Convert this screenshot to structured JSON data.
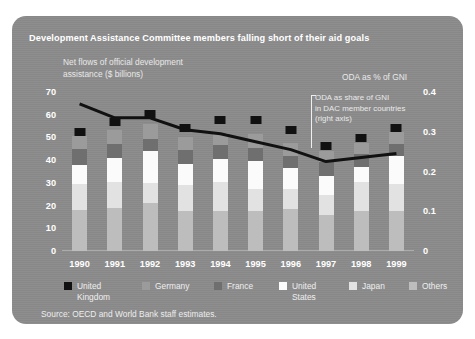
{
  "figure": {
    "title": "Development Assistance Committee members falling short of their aid goals",
    "left_axis_note": "Net flows of official development\nassistance ($ billions)",
    "right_axis_note": "ODA as % of GNI",
    "callout": "ODA as share of GNI\nin DAC member countries\n(right axis)",
    "source": "Source: OECD and World Bank staff estimates.",
    "panel_color": "#8b8b8b",
    "text_color": "#ffffff"
  },
  "chart_data": {
    "type": "bar",
    "title": "Development Assistance Committee members falling short of their aid goals",
    "subtitle": "Net flows of official development assistance ($ billions)",
    "xlabel": "",
    "ylabel": "Net flows of official development assistance ($ billions)",
    "ylabel_right": "ODA as % of GNI",
    "ylim": [
      0,
      70
    ],
    "ylim_right": [
      0,
      0.4
    ],
    "yticks": [
      "0",
      "10",
      "20",
      "30",
      "40",
      "50",
      "60",
      "70"
    ],
    "yticks_right": [
      "0",
      "0.1",
      "0.2",
      "0.3",
      "0.4"
    ],
    "grid": false,
    "legend_position": "bottom",
    "stacked": true,
    "categories": [
      "1990",
      "1991",
      "1992",
      "1993",
      "1994",
      "1995",
      "1996",
      "1997",
      "1998",
      "1999"
    ],
    "series": [
      {
        "name": "Others",
        "color": "#bdbdbd",
        "values": [
          18.0,
          19.0,
          21.0,
          17.5,
          17.5,
          17.5,
          18.5,
          16.0,
          17.5,
          17.5
        ]
      },
      {
        "name": "Japan",
        "color": "#e2e2e2",
        "values": [
          11.5,
          11.5,
          9.0,
          11.5,
          13.0,
          10.0,
          9.0,
          8.5,
          13.0,
          12.0
        ]
      },
      {
        "name": "United States",
        "color": "#fbfbfb",
        "values": [
          8.5,
          10.5,
          14.0,
          9.5,
          10.0,
          12.0,
          9.0,
          8.5,
          6.5,
          12.5
        ]
      },
      {
        "name": "France",
        "color": "#6f6f6f",
        "values": [
          7.0,
          6.0,
          5.5,
          6.0,
          6.0,
          6.0,
          5.5,
          6.0,
          5.5,
          5.0
        ]
      },
      {
        "name": "Germany",
        "color": "#9b9b9b",
        "values": [
          5.5,
          6.5,
          6.5,
          5.5,
          5.5,
          6.0,
          5.5,
          5.0,
          5.0,
          5.5
        ]
      }
    ],
    "line_series": {
      "name": "ODA as share of GNI in DAC member countries (right axis)",
      "axis": "right",
      "color": "#111111",
      "marker": "square",
      "values": [
        0.37,
        0.335,
        0.335,
        0.305,
        0.295,
        0.275,
        0.255,
        0.225,
        0.235,
        0.245
      ]
    },
    "markers": {
      "name": "United Kingdom",
      "color": "#111111",
      "values": [
        0.3,
        0.325,
        0.345,
        0.31,
        0.33,
        0.33,
        0.305,
        0.265,
        0.285,
        0.31
      ]
    },
    "annotations": [
      {
        "text": "ODA as % of GNI"
      },
      {
        "text": "ODA as share of GNI in DAC member countries (right axis)"
      }
    ]
  },
  "legend": {
    "items": [
      {
        "label": "United\nKingdom",
        "color": "#111111"
      },
      {
        "label": "Germany",
        "color": "#9b9b9b"
      },
      {
        "label": "France",
        "color": "#6f6f6f"
      },
      {
        "label": "United\nStates",
        "color": "#fbfbfb"
      },
      {
        "label": "Japan",
        "color": "#e2e2e2"
      },
      {
        "label": "Others",
        "color": "#bdbdbd"
      }
    ]
  }
}
